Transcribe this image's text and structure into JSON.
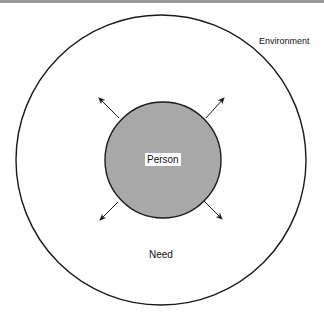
{
  "diagram": {
    "labels": {
      "environment": "Environment",
      "person": "Person",
      "need": "Need"
    },
    "colors": {
      "outline": "#1a1a1a",
      "person_fill": "#a8a8a8",
      "background": "#ffffff"
    },
    "shapes": {
      "outer_circle": {
        "cx": 161,
        "cy": 160,
        "r": 145
      },
      "inner_circle": {
        "cx": 163,
        "cy": 160,
        "r": 58
      },
      "arrows": [
        "up-left",
        "up-right",
        "down-left",
        "down-right"
      ]
    }
  }
}
